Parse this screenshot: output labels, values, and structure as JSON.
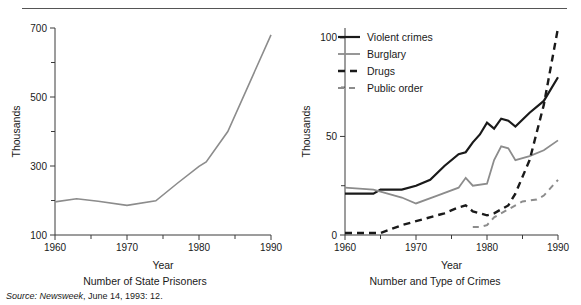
{
  "figure": {
    "source_prefix": "Source:",
    "source_publication": "Newsweek",
    "source_rest": ", June 14, 1993: 12."
  },
  "panels": {
    "left": {
      "caption": "Number of State Prisoners",
      "xlabel": "Year",
      "ylabel": "Thousands"
    },
    "right": {
      "caption": "Number and Type of Crimes",
      "xlabel": "Year",
      "ylabel": "Thousands"
    }
  },
  "colors": {
    "black": "#1a1a1a",
    "gray": "#8c8c8c",
    "axis": "#3a3a3a",
    "rule": "#555555"
  },
  "chart_data": [
    {
      "id": "state-prisoners",
      "type": "line",
      "title": "Number of State Prisoners",
      "xlabel": "Year",
      "ylabel": "Thousands",
      "xlim": [
        1960,
        1990
      ],
      "ylim": [
        100,
        700
      ],
      "xticks": [
        1960,
        1965,
        1970,
        1975,
        1980,
        1985,
        1990
      ],
      "xticklabels": [
        "1960",
        "",
        "1970",
        "",
        "1980",
        "",
        "1990"
      ],
      "yticks": [
        100,
        200,
        300,
        400,
        500,
        600,
        700
      ],
      "yticklabels": [
        "100",
        "",
        "300",
        "",
        "500",
        "",
        "700"
      ],
      "grid": false,
      "legend": "none",
      "series": [
        {
          "name": "State prisoners",
          "color": "#8c8c8c",
          "style": "solid",
          "width": 1.6,
          "x": [
            1960,
            1963,
            1966,
            1970,
            1974,
            1977,
            1980,
            1981,
            1984,
            1990
          ],
          "values": [
            196,
            205,
            198,
            186,
            199,
            250,
            299,
            312,
            400,
            680
          ]
        }
      ]
    },
    {
      "id": "number-and-type-of-crimes",
      "type": "line",
      "title": "Number and Type of Crimes",
      "xlabel": "Year",
      "ylabel": "Thousands",
      "xlim": [
        1960,
        1990
      ],
      "ylim": [
        0,
        105
      ],
      "xticks": [
        1960,
        1965,
        1970,
        1975,
        1980,
        1985,
        1990
      ],
      "xticklabels": [
        "1960",
        "",
        "1970",
        "",
        "1980",
        "",
        "1990"
      ],
      "yticks": [
        0,
        25,
        50,
        75,
        100
      ],
      "yticklabels": [
        "0",
        "",
        "50",
        "",
        "100"
      ],
      "grid": false,
      "legend": "upper left",
      "series": [
        {
          "name": "Violent crimes",
          "color": "#1a1a1a",
          "style": "solid",
          "width": 2.2,
          "x": [
            1960,
            1964,
            1965,
            1968,
            1970,
            1972,
            1974,
            1976,
            1977,
            1978,
            1979,
            1980,
            1981,
            1982,
            1983,
            1984,
            1986,
            1988,
            1990
          ],
          "values": [
            21,
            21,
            23,
            23,
            25,
            28,
            35,
            41,
            42,
            47,
            51,
            57,
            54,
            59,
            58,
            55,
            62,
            68,
            80
          ]
        },
        {
          "name": "Burglary",
          "color": "#8c8c8c",
          "style": "solid",
          "width": 1.8,
          "x": [
            1960,
            1964,
            1965,
            1968,
            1970,
            1973,
            1976,
            1977,
            1978,
            1980,
            1981,
            1982,
            1983,
            1984,
            1986,
            1988,
            1990
          ],
          "values": [
            24,
            23,
            22,
            19,
            16,
            20,
            24,
            29,
            25,
            26,
            38,
            45,
            44,
            38,
            40,
            43,
            48
          ]
        },
        {
          "name": "Drugs",
          "color": "#1a1a1a",
          "style": "dashed",
          "width": 2.4,
          "dash": "7,5",
          "x": [
            1960,
            1965,
            1968,
            1971,
            1974,
            1976,
            1977,
            1978,
            1980,
            1981,
            1983,
            1984,
            1986,
            1988,
            1990
          ],
          "values": [
            1,
            1,
            5,
            8,
            11,
            14,
            15,
            12,
            10,
            11,
            15,
            21,
            38,
            66,
            105
          ]
        },
        {
          "name": "Public order",
          "color": "#8c8c8c",
          "style": "dashed",
          "width": 2.0,
          "dash": "6,5",
          "x": [
            1978,
            1979,
            1980,
            1981,
            1983,
            1985,
            1987,
            1988,
            1990
          ],
          "values": [
            4,
            4,
            5,
            9,
            13,
            17,
            18,
            20,
            28
          ]
        }
      ]
    }
  ]
}
